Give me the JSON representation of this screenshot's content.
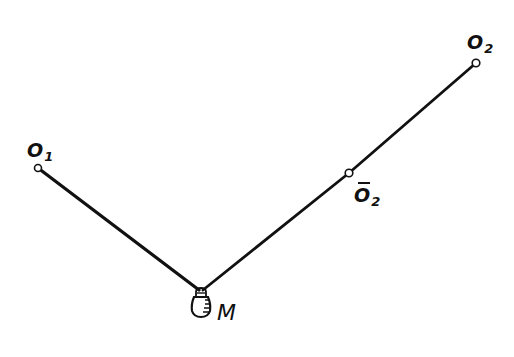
{
  "diagram": {
    "type": "mechanics-pendulum-schematic",
    "colors": {
      "ink": "#111111",
      "background": "#ffffff"
    },
    "points": {
      "O1": {
        "label_main": "O",
        "label_sub": "1",
        "x": 38,
        "y": 168
      },
      "O2": {
        "label_main": "O",
        "label_sub": "2",
        "x": 476,
        "y": 63
      },
      "O2bar": {
        "label_main": "O",
        "label_sub": "2",
        "overbar": true,
        "x": 349,
        "y": 173
      },
      "M": {
        "label": "M",
        "x": 201,
        "y": 290
      }
    },
    "segments": [
      {
        "from": "O1",
        "to": "M"
      },
      {
        "from": "M",
        "to": "O2bar"
      },
      {
        "from": "O2bar",
        "to": "O2"
      }
    ]
  }
}
